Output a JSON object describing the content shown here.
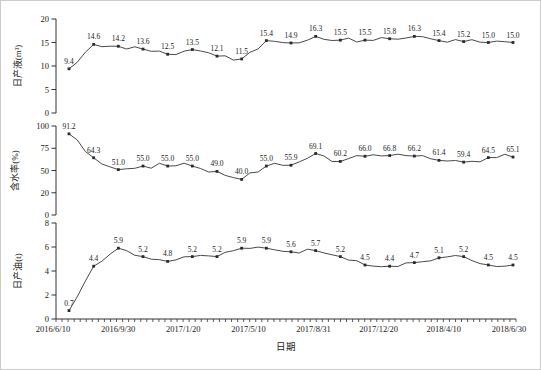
{
  "figure": {
    "xlabel": "日期",
    "x_tick_labels": [
      "2016/6/10",
      "2016/9/30",
      "2017/1/20",
      "2017/5/10",
      "2017/8/31",
      "2017/12/20",
      "2018/4/10",
      "2018/6/30"
    ],
    "line_color": "#4a4a4a",
    "marker_color": "#2b2b2b",
    "axis_color": "#333333",
    "text_color": "#1a1a1a",
    "frame_color": "#cccccc",
    "background": "#ffffff"
  },
  "chart_data": [
    {
      "type": "line",
      "ylabel": "日产液(m³)",
      "ylim": [
        0,
        20
      ],
      "yticks": [
        {
          "pos": 0,
          "label": "0"
        },
        {
          "pos": 5,
          "label": "5"
        },
        {
          "pos": 10,
          "label": "10"
        },
        {
          "pos": 15,
          "label": "15"
        },
        {
          "pos": 20,
          "label": "20"
        }
      ],
      "values": [
        9.4,
        14.6,
        14.2,
        13.6,
        12.5,
        13.5,
        12.1,
        11.5,
        15.4,
        14.9,
        16.3,
        15.5,
        15.5,
        15.8,
        16.3,
        15.4,
        15.2,
        15.0,
        15.0
      ],
      "labels": [
        "9.4",
        "14.6",
        "14.2",
        "13.6",
        "12.5",
        "13.5",
        "12.1",
        "11.5",
        "15.4",
        "14.9",
        "16.3",
        "15.5",
        "15.5",
        "15.8",
        "16.3",
        "15.4",
        "15.2",
        "15.0",
        "15.0"
      ]
    },
    {
      "type": "line",
      "ylabel": "含水率(%)",
      "ylim": [
        0,
        100
      ],
      "yticks": [
        {
          "pos": 0,
          "label": "0"
        },
        {
          "pos": 25,
          "label": "20"
        },
        {
          "pos": 50,
          "label": "50"
        },
        {
          "pos": 75,
          "label": "75"
        },
        {
          "pos": 100,
          "label": "100"
        }
      ],
      "values": [
        91.2,
        64.3,
        51.0,
        55.0,
        55.0,
        55.0,
        49.0,
        40.0,
        55.0,
        55.9,
        69.1,
        60.2,
        66.0,
        66.8,
        66.2,
        61.4,
        59.4,
        64.5,
        65.1
      ],
      "labels": [
        "91.2",
        "64.3",
        "51.0",
        "55.0",
        "55.0",
        "55.0",
        "49.0",
        "40.0",
        "55.0",
        "55.9",
        "69.1",
        "60.2",
        "66.0",
        "66.8",
        "66.2",
        "61.4",
        "59.4",
        "64.5",
        "65.1"
      ]
    },
    {
      "type": "line",
      "ylabel": "日产油(t)",
      "xlabel": "日期",
      "x_tick_labels": [
        "2016/6/10",
        "2016/9/30",
        "2017/1/20",
        "2017/5/10",
        "2017/8/31",
        "2017/12/20",
        "2018/4/10",
        "2018/6/30"
      ],
      "ylim": [
        0,
        8
      ],
      "yticks": [
        {
          "pos": 0,
          "label": "0"
        },
        {
          "pos": 2,
          "label": "2"
        },
        {
          "pos": 4,
          "label": "4"
        },
        {
          "pos": 6,
          "label": "6"
        },
        {
          "pos": 8,
          "label": "8"
        }
      ],
      "values": [
        0.7,
        4.4,
        5.9,
        5.2,
        4.8,
        5.2,
        5.2,
        5.9,
        5.9,
        5.6,
        5.7,
        5.2,
        4.5,
        4.4,
        4.7,
        5.1,
        5.2,
        4.5,
        4.5
      ],
      "labels": [
        "0.7",
        "4.4",
        "5.9",
        "5.2",
        "4.8",
        "5.2",
        "5.2",
        "5.9",
        "5.9",
        "5.6",
        "5.7",
        "5.2",
        "4.5",
        "4.4",
        "4.7",
        "5.1",
        "5.2",
        "4.5",
        "4.5"
      ]
    }
  ]
}
